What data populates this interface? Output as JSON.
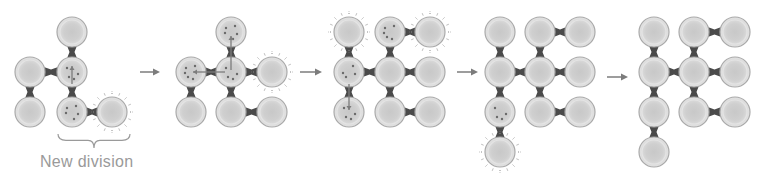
{
  "caption": "New division",
  "colors": {
    "cell_fill": "#d6d6d6",
    "cell_core": "#c4c4c4",
    "cell_rim": "#a9a9a9",
    "junction": "#4a4a4a",
    "arrow": "#7c7c7c",
    "halo": "#8a8a8a",
    "dot": "#6a6a6a",
    "brace": "#9a9a9a"
  },
  "cell_radius": 15,
  "stages": [
    {
      "name": "stage-1",
      "cells": [
        {
          "x": 72,
          "y": 32
        },
        {
          "x": 30,
          "y": 72
        },
        {
          "x": 72,
          "y": 72,
          "dots": true
        },
        {
          "x": 30,
          "y": 112
        },
        {
          "x": 72,
          "y": 112,
          "dots": true
        },
        {
          "x": 112,
          "y": 112,
          "halo": true
        }
      ],
      "links": [
        [
          0,
          2
        ],
        [
          1,
          2
        ],
        [
          1,
          3
        ],
        [
          2,
          4
        ],
        [
          4,
          5
        ]
      ],
      "signals": [
        {
          "from": [
            72,
            84
          ],
          "to": [
            72,
            66
          ]
        }
      ]
    },
    {
      "name": "stage-2",
      "cells": [
        {
          "x": 231,
          "y": 32,
          "dots": true
        },
        {
          "x": 191,
          "y": 72,
          "dots": true
        },
        {
          "x": 231,
          "y": 72,
          "dots": true
        },
        {
          "x": 272,
          "y": 72,
          "halo": true
        },
        {
          "x": 191,
          "y": 112
        },
        {
          "x": 231,
          "y": 112
        },
        {
          "x": 272,
          "y": 112
        }
      ],
      "links": [
        [
          0,
          2
        ],
        [
          1,
          2
        ],
        [
          2,
          3
        ],
        [
          1,
          4
        ],
        [
          2,
          5
        ],
        [
          5,
          6
        ]
      ],
      "signals": [
        {
          "from": [
            231,
            70
          ],
          "to": [
            231,
            36
          ]
        },
        {
          "from": [
            225,
            72
          ],
          "to": [
            193,
            72
          ]
        }
      ]
    },
    {
      "name": "stage-3",
      "cells": [
        {
          "x": 349,
          "y": 32,
          "halo": true
        },
        {
          "x": 390,
          "y": 32,
          "dots": true
        },
        {
          "x": 430,
          "y": 32,
          "halo": true
        },
        {
          "x": 349,
          "y": 72,
          "dots": true
        },
        {
          "x": 390,
          "y": 72
        },
        {
          "x": 430,
          "y": 72
        },
        {
          "x": 349,
          "y": 112,
          "dots": true
        },
        {
          "x": 390,
          "y": 112
        },
        {
          "x": 430,
          "y": 112
        }
      ],
      "links": [
        [
          0,
          3
        ],
        [
          1,
          4
        ],
        [
          1,
          2
        ],
        [
          3,
          4
        ],
        [
          4,
          5
        ],
        [
          3,
          6
        ],
        [
          4,
          7
        ],
        [
          7,
          8
        ]
      ],
      "signals": [
        {
          "from": [
            349,
            84
          ],
          "to": [
            349,
            110
          ]
        }
      ]
    },
    {
      "name": "stage-4",
      "cells": [
        {
          "x": 500,
          "y": 32
        },
        {
          "x": 540,
          "y": 32
        },
        {
          "x": 580,
          "y": 32
        },
        {
          "x": 500,
          "y": 72
        },
        {
          "x": 540,
          "y": 72
        },
        {
          "x": 580,
          "y": 72
        },
        {
          "x": 500,
          "y": 112,
          "dots": true
        },
        {
          "x": 540,
          "y": 112
        },
        {
          "x": 580,
          "y": 112
        },
        {
          "x": 500,
          "y": 152,
          "halo": true
        }
      ],
      "links": [
        [
          0,
          3
        ],
        [
          1,
          4
        ],
        [
          1,
          2
        ],
        [
          3,
          4
        ],
        [
          4,
          5
        ],
        [
          3,
          6
        ],
        [
          4,
          7
        ],
        [
          7,
          8
        ],
        [
          6,
          9
        ]
      ],
      "signals": []
    },
    {
      "name": "stage-5",
      "cells": [
        {
          "x": 654,
          "y": 32
        },
        {
          "x": 694,
          "y": 32
        },
        {
          "x": 735,
          "y": 32
        },
        {
          "x": 654,
          "y": 72
        },
        {
          "x": 694,
          "y": 72
        },
        {
          "x": 735,
          "y": 72
        },
        {
          "x": 654,
          "y": 112
        },
        {
          "x": 694,
          "y": 112
        },
        {
          "x": 735,
          "y": 112
        },
        {
          "x": 654,
          "y": 152
        }
      ],
      "links": [
        [
          0,
          3
        ],
        [
          1,
          4
        ],
        [
          1,
          2
        ],
        [
          3,
          4
        ],
        [
          4,
          5
        ],
        [
          3,
          6
        ],
        [
          4,
          7
        ],
        [
          7,
          8
        ],
        [
          6,
          9
        ]
      ],
      "signals": []
    }
  ],
  "arrows": [
    {
      "x1": 140,
      "x2": 160,
      "y": 72
    },
    {
      "x1": 300,
      "x2": 322,
      "y": 72
    },
    {
      "x1": 457,
      "x2": 478,
      "y": 72
    },
    {
      "x1": 607,
      "x2": 628,
      "y": 77
    }
  ],
  "brace": {
    "x1": 58,
    "x2": 130,
    "y": 134,
    "depth": 14
  }
}
